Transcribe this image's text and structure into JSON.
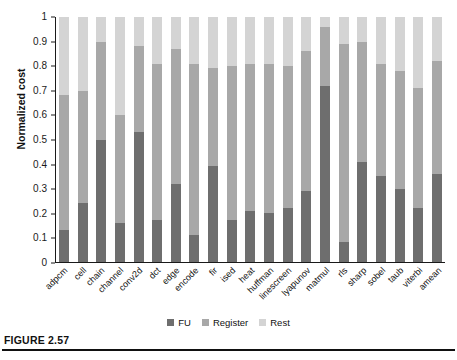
{
  "figure": {
    "caption": "FIGURE 2.57"
  },
  "legend": {
    "position": "bottom-center",
    "items": [
      {
        "label": "FU",
        "color": "#6e6e6e"
      },
      {
        "label": "Register",
        "color": "#a8a8a8"
      },
      {
        "label": "Rest",
        "color": "#d4d4d4"
      }
    ]
  },
  "chart_data": {
    "type": "bar",
    "subtype": "stacked-bar",
    "title": "",
    "xlabel": "",
    "ylabel": "Normalized cost",
    "ylim": [
      0,
      1
    ],
    "yticks": [
      0,
      0.1,
      0.2,
      0.3,
      0.4,
      0.5,
      0.6,
      0.7,
      0.8,
      0.9,
      1
    ],
    "ytick_labels": [
      "0",
      "0.1",
      "0.2",
      "0.3",
      "0.4",
      "0.5",
      "0.6",
      "0.7",
      "0.8",
      "0.9",
      "1"
    ],
    "grid": false,
    "normalized_total": 1,
    "categories": [
      "adpcm",
      "cell",
      "chain",
      "channel",
      "conv2d",
      "dct",
      "edge",
      "encode",
      "fir",
      "ised",
      "heat",
      "huffman",
      "linescreen",
      "lyapunov",
      "matmul",
      "rls",
      "sharp",
      "sobel",
      "taub",
      "viterbi",
      "amean"
    ],
    "series": [
      {
        "name": "FU",
        "color": "#6e6e6e",
        "values": [
          0.13,
          0.24,
          0.5,
          0.16,
          0.53,
          0.17,
          0.32,
          0.11,
          0.39,
          0.17,
          0.21,
          0.2,
          0.22,
          0.29,
          0.72,
          0.08,
          0.41,
          0.35,
          0.3,
          0.22,
          0.36
        ]
      },
      {
        "name": "Register",
        "color": "#a8a8a8",
        "values": [
          0.55,
          0.46,
          0.4,
          0.44,
          0.35,
          0.64,
          0.55,
          0.7,
          0.4,
          0.63,
          0.6,
          0.61,
          0.58,
          0.57,
          0.24,
          0.81,
          0.49,
          0.46,
          0.48,
          0.49,
          0.46
        ]
      },
      {
        "name": "Rest",
        "color": "#d4d4d4",
        "values": [
          0.32,
          0.3,
          0.1,
          0.4,
          0.12,
          0.19,
          0.13,
          0.19,
          0.21,
          0.2,
          0.19,
          0.19,
          0.2,
          0.14,
          0.04,
          0.11,
          0.1,
          0.19,
          0.22,
          0.29,
          0.18
        ]
      }
    ],
    "stack_tops": {
      "fu": [
        0.13,
        0.24,
        0.5,
        0.16,
        0.53,
        0.17,
        0.32,
        0.11,
        0.39,
        0.17,
        0.21,
        0.2,
        0.22,
        0.29,
        0.72,
        0.08,
        0.41,
        0.35,
        0.3,
        0.22,
        0.36
      ],
      "fu_plus_register": [
        0.68,
        0.7,
        0.9,
        0.6,
        0.88,
        0.81,
        0.87,
        0.81,
        0.79,
        0.8,
        0.81,
        0.81,
        0.8,
        0.86,
        0.96,
        0.89,
        0.9,
        0.81,
        0.78,
        0.71,
        0.82
      ],
      "total": [
        1,
        1,
        1,
        1,
        1,
        1,
        1,
        1,
        1,
        1,
        1,
        1,
        1,
        1,
        1,
        1,
        1,
        1,
        1,
        1,
        1
      ]
    }
  }
}
